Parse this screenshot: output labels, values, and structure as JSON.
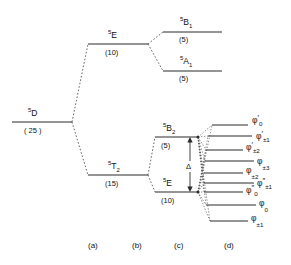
{
  "figure": {
    "kind": "energy-level-splitting-diagram",
    "line_color": "#2b2b2b",
    "connector_color": "#4a4a4a",
    "background": "#ffffff"
  },
  "columns": [
    {
      "id": "a",
      "label": "(a)",
      "x": 97
    },
    {
      "id": "b",
      "label": "(b)",
      "x": 141
    },
    {
      "id": "c",
      "label": "(c)",
      "x": 181
    },
    {
      "id": "d",
      "label": "(d)",
      "x": 231
    }
  ],
  "column_label_y": 248,
  "free_ion": {
    "term_superscript": "5",
    "term_letter": "D",
    "degeneracy": "( 25 )",
    "line": {
      "x1": 12,
      "x2": 72,
      "y": 122
    },
    "label_x": 28,
    "label_y": 116,
    "degeneracy_x": 24,
    "degeneracy_y": 133
  },
  "cubic": [
    {
      "name": "5E",
      "term_superscript": "5",
      "term_letter": "E",
      "term_subscript": "",
      "degeneracy": "(10)",
      "line": {
        "x1": 88,
        "x2": 148,
        "y": 44
      },
      "label_x": 108,
      "label_y": 38,
      "degeneracy_x": 105,
      "degeneracy_y": 55
    },
    {
      "name": "5T2",
      "term_superscript": "5",
      "term_letter": "T",
      "term_subscript": "2",
      "degeneracy": "(15)",
      "line": {
        "x1": 88,
        "x2": 148,
        "y": 175
      },
      "label_x": 108,
      "label_y": 169,
      "degeneracy_x": 105,
      "degeneracy_y": 186
    }
  ],
  "tetragonal": [
    {
      "name": "5B1",
      "term_superscript": "5",
      "term_letter": "B",
      "term_subscript": "1",
      "degeneracy": "(5)",
      "line": {
        "x1": 163,
        "x2": 222,
        "y": 32
      },
      "label_x": 180,
      "label_y": 25,
      "degeneracy_x": 179,
      "degeneracy_y": 42
    },
    {
      "name": "5A1",
      "term_superscript": "5",
      "term_letter": "A",
      "term_subscript": "1",
      "degeneracy": "(5)",
      "line": {
        "x1": 163,
        "x2": 222,
        "y": 71
      },
      "label_x": 180,
      "label_y": 64,
      "degeneracy_x": 179,
      "degeneracy_y": 81
    },
    {
      "name": "5B2",
      "term_superscript": "5",
      "term_letter": "B",
      "term_subscript": "2",
      "degeneracy": "(5)",
      "line": {
        "x1": 155,
        "x2": 198,
        "y": 137
      },
      "label_x": 163,
      "label_y": 131,
      "degeneracy_x": 161,
      "degeneracy_y": 148
    },
    {
      "name": "5E-low",
      "term_superscript": "5",
      "term_letter": "E",
      "term_subscript": "",
      "degeneracy": "(10)",
      "line": {
        "x1": 155,
        "x2": 198,
        "y": 192
      },
      "label_x": 163,
      "label_y": 186,
      "degeneracy_x": 161,
      "degeneracy_y": 203
    }
  ],
  "delta_arrow": {
    "label": "Δ",
    "x": 190,
    "y_top": 139,
    "y_bottom": 190,
    "label_x": 187,
    "label_y": 168
  },
  "sublevels": [
    {
      "phi": "φ",
      "prime": "′",
      "sub": "0",
      "line": {
        "x1": 212,
        "x2": 248,
        "y": 125
      },
      "label_x": 252,
      "label_y": 123,
      "from": "5B2"
    },
    {
      "phi": "φ",
      "prime": "′",
      "sub": "±1",
      "line": {
        "x1": 208,
        "x2": 252,
        "y": 136
      },
      "label_x": 256,
      "label_y": 139,
      "from": "5B2"
    },
    {
      "phi": "φ",
      "prime": "′",
      "sub": "±2",
      "line": {
        "x1": 206,
        "x2": 243,
        "y": 150
      },
      "label_x": 246,
      "label_y": 150,
      "from": "5B2"
    },
    {
      "phi": "φ",
      "prime": "",
      "sub": "±3",
      "line": {
        "x1": 205,
        "x2": 254,
        "y": 161
      },
      "label_x": 257,
      "label_y": 164,
      "from": "5B2"
    },
    {
      "phi": "φ",
      "prime": "",
      "sub": "±2",
      "line": {
        "x1": 204,
        "x2": 243,
        "y": 173
      },
      "label_x": 246,
      "label_y": 173,
      "from": "5E-low"
    },
    {
      "phi": "φ",
      "prime": "″",
      "sub": "±1",
      "line": {
        "x1": 204,
        "x2": 254,
        "y": 183
      },
      "label_x": 257,
      "label_y": 186,
      "from": "5E-low"
    },
    {
      "phi": "φ",
      "prime": "″",
      "sub": "0",
      "line": {
        "x1": 204,
        "x2": 243,
        "y": 192
      },
      "label_x": 246,
      "label_y": 193,
      "from": "5E-low"
    },
    {
      "phi": "φ",
      "prime": "",
      "sub": "0",
      "line": {
        "x1": 206,
        "x2": 256,
        "y": 205
      },
      "label_x": 259,
      "label_y": 206,
      "from": "5E-low"
    },
    {
      "phi": "φ",
      "prime": "",
      "sub": "±1",
      "line": {
        "x1": 210,
        "x2": 248,
        "y": 221
      },
      "label_x": 251,
      "label_y": 221,
      "from": "5E-low"
    }
  ],
  "branch_nodes": {
    "free_ion_right": {
      "x": 72,
      "y": 122
    },
    "cubic_e_left": {
      "x": 88,
      "y": 44
    },
    "cubic_t2_left": {
      "x": 88,
      "y": 175
    },
    "cubic_e_right": {
      "x": 148,
      "y": 44
    },
    "cubic_t2_right": {
      "x": 148,
      "y": 175
    },
    "b1_left": {
      "x": 163,
      "y": 32
    },
    "a1_left": {
      "x": 163,
      "y": 71
    },
    "b2_right": {
      "x": 198,
      "y": 137
    },
    "e_low_right": {
      "x": 198,
      "y": 192
    },
    "b2_left": {
      "x": 155,
      "y": 137
    },
    "e_low_left": {
      "x": 155,
      "y": 192
    }
  }
}
